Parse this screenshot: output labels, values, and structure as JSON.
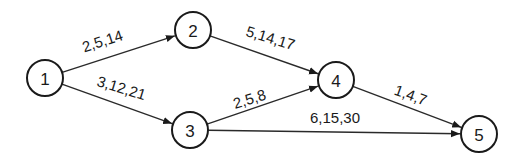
{
  "diagram": {
    "type": "activity-network",
    "nodes": [
      {
        "id": "1",
        "label": "1",
        "x": 45,
        "y": 78
      },
      {
        "id": "2",
        "label": "2",
        "x": 193,
        "y": 30
      },
      {
        "id": "3",
        "label": "3",
        "x": 190,
        "y": 130
      },
      {
        "id": "4",
        "label": "4",
        "x": 336,
        "y": 80
      },
      {
        "id": "5",
        "label": "5",
        "x": 479,
        "y": 134
      }
    ],
    "edges": [
      {
        "from": "1",
        "to": "2",
        "label": "2,5,14",
        "lx": 104,
        "ly": 46,
        "rot": -18
      },
      {
        "from": "1",
        "to": "3",
        "label": "3,12,21",
        "lx": 120,
        "ly": 93,
        "rot": 17
      },
      {
        "from": "2",
        "to": "4",
        "label": "5,14,17",
        "lx": 269,
        "ly": 43,
        "rot": 17
      },
      {
        "from": "3",
        "to": "4",
        "label": "2,5,8",
        "lx": 251,
        "ly": 104,
        "rot": -17
      },
      {
        "from": "4",
        "to": "5",
        "label": "1,4,7",
        "lx": 409,
        "ly": 100,
        "rot": 20
      },
      {
        "from": "3",
        "to": "5",
        "label": "6,15,30",
        "lx": 335,
        "ly": 123,
        "rot": 0
      }
    ],
    "node_radius": 18,
    "colors": {
      "stroke": "#1a1a1a",
      "background": "#ffffff"
    }
  }
}
